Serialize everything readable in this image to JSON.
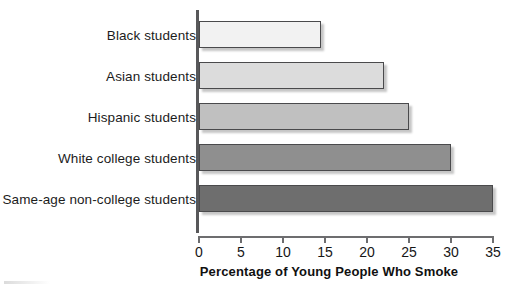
{
  "chart_data": {
    "type": "bar",
    "orientation": "horizontal",
    "title": "",
    "xlabel": "Percentage of Young People Who Smoke",
    "ylabel": "",
    "categories": [
      "Black students",
      "Asian students",
      "Hispanic students",
      "White college students",
      "Same-age non-college students"
    ],
    "values": [
      14.5,
      22,
      25,
      30,
      35
    ],
    "bar_colors": [
      "#f2f2f2",
      "#dcdcdc",
      "#c0c0c0",
      "#8f8f8f",
      "#6e6e6e"
    ],
    "xlim": [
      0,
      35
    ],
    "xticks": [
      0,
      5,
      10,
      15,
      20,
      25,
      30,
      35
    ],
    "xtick_labels": [
      "0",
      "5",
      "10",
      "15",
      "20",
      "25",
      "30",
      "35"
    ],
    "grid": false,
    "legend": false
  },
  "axis": {
    "title": "Percentage of Young People Who Smoke"
  }
}
